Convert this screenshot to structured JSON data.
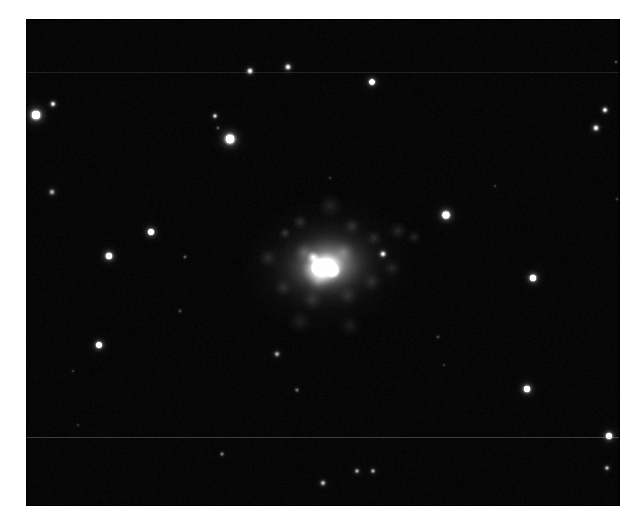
{
  "figure": {
    "kind": "astronomical-image",
    "background_color": "#ffffff",
    "sky_color": "#060606",
    "star_color": "#ffffff",
    "galaxy_color": "#ffffff"
  },
  "image_frame": {
    "x": 26,
    "y": 19,
    "width": 594,
    "height": 487,
    "border_color": "#0a0a0a"
  },
  "artifacts": {
    "seam_lines": [
      {
        "name": "upper-scan-seam",
        "y": 72,
        "opacity": 0.14,
        "thickness": 1
      },
      {
        "name": "lower-scan-seam",
        "y": 437,
        "opacity": 0.3,
        "thickness": 1
      }
    ],
    "noise": {
      "grain_opacity": 0.22,
      "grain_scale": 2
    }
  },
  "galaxy": {
    "name": "central-galaxy",
    "core_x": 327,
    "core_y": 265,
    "core_radius": 22,
    "inner_halo_rx": 62,
    "inner_halo_ry": 46,
    "outer_halo_rx": 100,
    "outer_halo_ry": 78,
    "position_angle_deg": -8,
    "clumps": [
      {
        "x": 285,
        "y": 233,
        "r": 7,
        "b": 0.55
      },
      {
        "x": 300,
        "y": 222,
        "r": 9,
        "b": 0.4
      },
      {
        "x": 352,
        "y": 226,
        "r": 10,
        "b": 0.38
      },
      {
        "x": 374,
        "y": 238,
        "r": 9,
        "b": 0.34
      },
      {
        "x": 398,
        "y": 231,
        "r": 11,
        "b": 0.3
      },
      {
        "x": 414,
        "y": 237,
        "r": 9,
        "b": 0.28
      },
      {
        "x": 268,
        "y": 258,
        "r": 12,
        "b": 0.3
      },
      {
        "x": 283,
        "y": 288,
        "r": 11,
        "b": 0.28
      },
      {
        "x": 312,
        "y": 300,
        "r": 13,
        "b": 0.3
      },
      {
        "x": 348,
        "y": 296,
        "r": 12,
        "b": 0.28
      },
      {
        "x": 372,
        "y": 282,
        "r": 12,
        "b": 0.26
      },
      {
        "x": 392,
        "y": 268,
        "r": 11,
        "b": 0.24
      },
      {
        "x": 330,
        "y": 206,
        "r": 14,
        "b": 0.26
      },
      {
        "x": 304,
        "y": 252,
        "r": 12,
        "b": 0.55
      },
      {
        "x": 344,
        "y": 252,
        "r": 12,
        "b": 0.5
      },
      {
        "x": 318,
        "y": 282,
        "r": 13,
        "b": 0.45
      },
      {
        "x": 300,
        "y": 322,
        "r": 14,
        "b": 0.16
      },
      {
        "x": 350,
        "y": 326,
        "r": 13,
        "b": 0.14
      }
    ]
  },
  "stars": [
    {
      "name": "star-bright-upper-left",
      "x": 36,
      "y": 115,
      "r": 9.5,
      "b": 1.0
    },
    {
      "name": "star-small-upper-left",
      "x": 53,
      "y": 104,
      "r": 4.5,
      "b": 0.8
    },
    {
      "name": "star-bright-upper-left-inner",
      "x": 230,
      "y": 139,
      "r": 10.0,
      "b": 1.0
    },
    {
      "name": "star-small-above-bright",
      "x": 215,
      "y": 116,
      "r": 4.0,
      "b": 0.7
    },
    {
      "name": "star-faint-above-bright",
      "x": 218,
      "y": 128,
      "r": 3.0,
      "b": 0.28
    },
    {
      "name": "star-top-mid-left",
      "x": 250,
      "y": 71,
      "r": 5.0,
      "b": 0.92
    },
    {
      "name": "star-top-mid-right",
      "x": 288,
      "y": 67,
      "r": 5.0,
      "b": 0.9
    },
    {
      "name": "star-top-center",
      "x": 372,
      "y": 82,
      "r": 6.0,
      "b": 0.95
    },
    {
      "name": "star-top-right-upper",
      "x": 605,
      "y": 110,
      "r": 4.5,
      "b": 0.85
    },
    {
      "name": "star-top-right-lower",
      "x": 596,
      "y": 128,
      "r": 5.0,
      "b": 0.9
    },
    {
      "name": "star-left-mid-upper",
      "x": 52,
      "y": 192,
      "r": 5.0,
      "b": 0.55
    },
    {
      "name": "star-left-mid",
      "x": 151,
      "y": 232,
      "r": 6.5,
      "b": 0.95
    },
    {
      "name": "star-left-lower-mid",
      "x": 109,
      "y": 256,
      "r": 7.0,
      "b": 0.95
    },
    {
      "name": "star-left-bottom",
      "x": 99,
      "y": 345,
      "r": 6.5,
      "b": 0.92
    },
    {
      "name": "star-faint-left-a",
      "x": 185,
      "y": 257,
      "r": 3.0,
      "b": 0.3
    },
    {
      "name": "star-faint-left-b",
      "x": 180,
      "y": 311,
      "r": 3.0,
      "b": 0.24
    },
    {
      "name": "star-faint-left-c",
      "x": 73,
      "y": 371,
      "r": 2.5,
      "b": 0.2
    },
    {
      "name": "star-right-of-galaxy",
      "x": 383,
      "y": 254,
      "r": 5.0,
      "b": 0.8
    },
    {
      "name": "star-right-halo-edge",
      "x": 446,
      "y": 215,
      "r": 8.0,
      "b": 1.0
    },
    {
      "name": "star-right-mid",
      "x": 533,
      "y": 278,
      "r": 7.0,
      "b": 0.95
    },
    {
      "name": "star-right-lower",
      "x": 527,
      "y": 389,
      "r": 7.0,
      "b": 0.95
    },
    {
      "name": "star-below-galaxy",
      "x": 277,
      "y": 354,
      "r": 4.5,
      "b": 0.55
    },
    {
      "name": "star-below-galaxy-faint",
      "x": 297,
      "y": 390,
      "r": 3.5,
      "b": 0.35
    },
    {
      "name": "star-right-faint-a",
      "x": 438,
      "y": 337,
      "r": 3.0,
      "b": 0.22
    },
    {
      "name": "star-right-faint-b",
      "x": 444,
      "y": 365,
      "r": 2.5,
      "b": 0.18
    },
    {
      "name": "star-corner-bottom-right",
      "x": 609,
      "y": 436,
      "r": 6.5,
      "b": 1.0
    },
    {
      "name": "star-corner-bottom-right-low",
      "x": 607,
      "y": 468,
      "r": 4.0,
      "b": 0.6
    },
    {
      "name": "star-below-seam-left",
      "x": 222,
      "y": 454,
      "r": 3.5,
      "b": 0.4
    },
    {
      "name": "star-below-seam-pair-a",
      "x": 357,
      "y": 471,
      "r": 4.0,
      "b": 0.55
    },
    {
      "name": "star-below-seam-pair-b",
      "x": 373,
      "y": 471,
      "r": 4.0,
      "b": 0.55
    },
    {
      "name": "star-below-seam-center",
      "x": 323,
      "y": 483,
      "r": 4.5,
      "b": 0.62
    },
    {
      "name": "star-faint-top-right-edge",
      "x": 616,
      "y": 62,
      "r": 2.5,
      "b": 0.3
    },
    {
      "name": "star-faint-right-edge",
      "x": 617,
      "y": 199,
      "r": 2.5,
      "b": 0.22
    },
    {
      "name": "star-faint-mid-top",
      "x": 495,
      "y": 186,
      "r": 2.5,
      "b": 0.18
    },
    {
      "name": "star-faint-upper-mid",
      "x": 330,
      "y": 178,
      "r": 2.5,
      "b": 0.2
    },
    {
      "name": "star-faint-lower-left",
      "x": 78,
      "y": 425,
      "r": 2.5,
      "b": 0.16
    }
  ]
}
